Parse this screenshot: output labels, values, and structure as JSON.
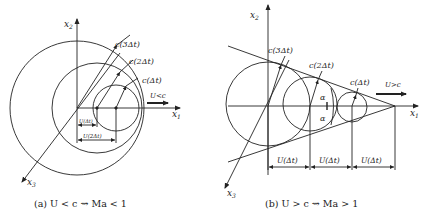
{
  "panel_a": {
    "axes": {
      "x1": "x",
      "x1_sub": "1",
      "x2": "x",
      "x2_sub": "2",
      "x3": "x",
      "x3_sub": "3"
    },
    "labels": {
      "c3": "c(3Δt)",
      "c2": "c(2Δt)",
      "c1": "c(Δt)",
      "velocity": "U<c",
      "u1": "U(Δt)",
      "u2": "U(2Δt)"
    },
    "caption": "(a) U < c  ⇝  Ma < 1"
  },
  "panel_b": {
    "axes": {
      "x1": "x",
      "x1_sub": "1",
      "x2": "x",
      "x2_sub": "2",
      "x3": "x",
      "x3_sub": "3"
    },
    "labels": {
      "c3": "c(3Δt)",
      "c2": "c(2Δt)",
      "c1": "c(Δt)",
      "velocity": "U>c",
      "alpha_top": "α",
      "alpha_bottom": "α",
      "u1": "U(Δt)",
      "u2": "U(Δt)",
      "u3": "U(Δt)"
    },
    "caption": "(b) U > c  ⇝  Ma > 1"
  }
}
